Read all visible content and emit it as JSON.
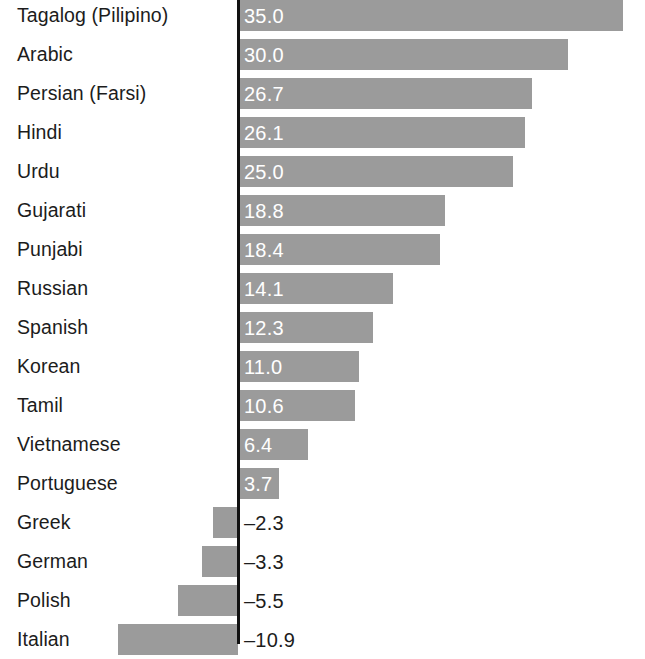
{
  "chart_data": {
    "type": "bar",
    "orientation": "horizontal",
    "title": "",
    "subtitle": "",
    "xlabel": "",
    "ylabel": "",
    "grid": false,
    "legend": null,
    "zero_line": true,
    "xlim": [
      -12,
      37
    ],
    "categories": [
      "Tagalog (Pilipino)",
      "Arabic",
      "Persian (Farsi)",
      "Hindi",
      "Urdu",
      "Gujarati",
      "Punjabi",
      "Russian",
      "Spanish",
      "Korean",
      "Tamil",
      "Vietnamese",
      "Portuguese",
      "Greek",
      "German",
      "Polish",
      "Italian"
    ],
    "values": [
      35.0,
      30.0,
      26.7,
      26.1,
      25.0,
      18.8,
      18.4,
      14.1,
      12.3,
      11.0,
      10.6,
      6.4,
      3.7,
      -2.3,
      -3.3,
      -5.5,
      -10.9
    ],
    "value_labels": [
      "35.0",
      "30.0",
      "26.7",
      "26.1",
      "25.0",
      "18.8",
      "18.4",
      "14.1",
      "12.3",
      "11.0",
      "10.6",
      "6.4",
      "3.7",
      "–2.3",
      "–3.3",
      "–5.5",
      "–10.9"
    ],
    "bar_color": "#9b9b9b",
    "positive_label_color": "#ffffff",
    "negative_label_color": "#1c1c1c",
    "axis_color": "#111111"
  },
  "rows": [
    {
      "label": "Tagalog (Pilipino)",
      "value": 35.0,
      "value_label": "35.0"
    },
    {
      "label": "Arabic",
      "value": 30.0,
      "value_label": "30.0"
    },
    {
      "label": "Persian (Farsi)",
      "value": 26.7,
      "value_label": "26.7"
    },
    {
      "label": "Hindi",
      "value": 26.1,
      "value_label": "26.1"
    },
    {
      "label": "Urdu",
      "value": 25.0,
      "value_label": "25.0"
    },
    {
      "label": "Gujarati",
      "value": 18.8,
      "value_label": "18.8"
    },
    {
      "label": "Punjabi",
      "value": 18.4,
      "value_label": "18.4"
    },
    {
      "label": "Russian",
      "value": 14.1,
      "value_label": "14.1"
    },
    {
      "label": "Spanish",
      "value": 12.3,
      "value_label": "12.3"
    },
    {
      "label": "Korean",
      "value": 11.0,
      "value_label": "11.0"
    },
    {
      "label": "Tamil",
      "value": 10.6,
      "value_label": "10.6"
    },
    {
      "label": "Vietnamese",
      "value": 6.4,
      "value_label": "6.4"
    },
    {
      "label": "Portuguese",
      "value": 3.7,
      "value_label": "3.7"
    },
    {
      "label": "Greek",
      "value": -2.3,
      "value_label": "–2.3"
    },
    {
      "label": "German",
      "value": -3.3,
      "value_label": "–3.3"
    },
    {
      "label": "Polish",
      "value": -5.5,
      "value_label": "–5.5"
    },
    {
      "label": "Italian",
      "value": -10.9,
      "value_label": "–10.9"
    }
  ]
}
